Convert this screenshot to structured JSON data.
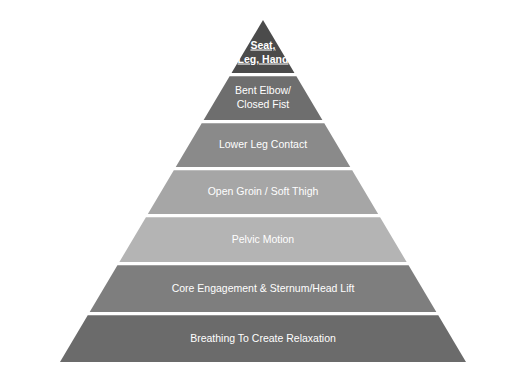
{
  "figure": {
    "type": "pyramid-diagram",
    "title": "",
    "background_color": "#ffffff",
    "label_color": "#ffffff",
    "divider_color": "#ffffff",
    "apex": {
      "x": 263,
      "y": 20
    },
    "base": {
      "left_x": 60,
      "right_x": 466,
      "y": 362
    },
    "tier_count": 7,
    "tiers": [
      {
        "index": 1,
        "position": "apex",
        "label": "Seat,\nLeg, Hand",
        "lines": [
          "Seat,",
          "Leg, Hand"
        ],
        "color": "#4b4b4b",
        "emphasis": "bold-underline",
        "top_y": 20,
        "bottom_y": 73
      },
      {
        "index": 2,
        "position": "second",
        "label": "Bent Elbow/\nClosed Fist",
        "lines": [
          "Bent Elbow/",
          "Closed Fist"
        ],
        "color": "#6e6e6e",
        "emphasis": "normal",
        "top_y": 76,
        "bottom_y": 120
      },
      {
        "index": 3,
        "position": "third",
        "label": "Lower Leg Contact",
        "lines": [
          "Lower Leg Contact"
        ],
        "color": "#8a8a8a",
        "emphasis": "normal",
        "top_y": 123,
        "bottom_y": 167
      },
      {
        "index": 4,
        "position": "fourth",
        "label": "Open Groin / Soft Thigh",
        "lines": [
          "Open Groin / Soft Thigh"
        ],
        "color": "#a6a6a6",
        "emphasis": "normal",
        "top_y": 170,
        "bottom_y": 214
      },
      {
        "index": 5,
        "position": "fifth",
        "label": "Pelvic Motion",
        "lines": [
          "Pelvic Motion"
        ],
        "color": "#b4b4b4",
        "emphasis": "normal",
        "top_y": 217,
        "bottom_y": 262
      },
      {
        "index": 6,
        "position": "sixth",
        "label": "Core Engagement & Sternum/Head Lift",
        "lines": [
          "Core Engagement & Sternum/Head Lift"
        ],
        "color": "#7e7e7e",
        "emphasis": "normal",
        "top_y": 265,
        "bottom_y": 312
      },
      {
        "index": 7,
        "position": "base",
        "label": "Breathing To Create Relaxation",
        "lines": [
          "Breathing To Create Relaxation"
        ],
        "color": "#6b6b6b",
        "emphasis": "normal",
        "top_y": 315,
        "bottom_y": 362
      }
    ]
  }
}
